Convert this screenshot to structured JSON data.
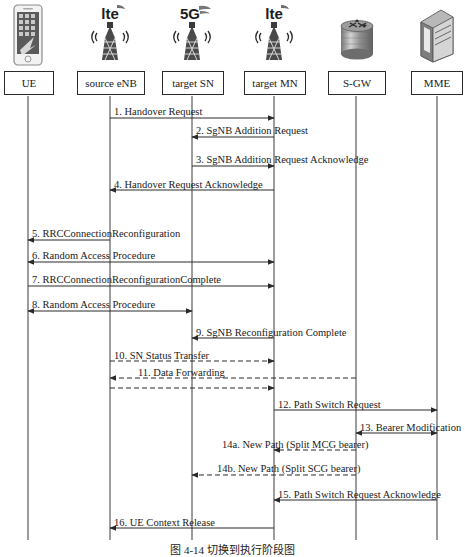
{
  "diagram": {
    "type": "sequence-diagram",
    "width": 465,
    "height": 555,
    "caption": "图 4-14  切换到执行阶段图",
    "line_color": "#2a2a2a",
    "box_border_color": "#2b2b2b"
  },
  "actors": [
    {
      "id": "ue",
      "label": "UE",
      "icon": "smartphone-icon",
      "x": 28,
      "box_x": 4,
      "box_w": 48
    },
    {
      "id": "source_enb",
      "label": "source eNB",
      "icon": "lte-tower-icon",
      "x": 110,
      "box_x": 77,
      "box_w": 66
    },
    {
      "id": "target_sn",
      "label": "target SN",
      "icon": "5g-tower-icon",
      "x": 192,
      "box_x": 162,
      "box_w": 60
    },
    {
      "id": "target_mn",
      "label": "target MN",
      "icon": "lte-tower-icon",
      "x": 274,
      "box_x": 244,
      "box_w": 60
    },
    {
      "id": "sgw",
      "label": "S-GW",
      "icon": "gateway-icon",
      "x": 356,
      "box_x": 328,
      "box_w": 56
    },
    {
      "id": "mme",
      "label": "MME",
      "icon": "server-icon",
      "x": 437,
      "box_x": 411,
      "box_w": 50
    }
  ],
  "messages": [
    {
      "num": "1.",
      "label": "1. Handover Request",
      "from": "source_enb",
      "to": "target_mn",
      "y": 118,
      "style": "solid",
      "dir": "right",
      "label_x": 114,
      "label_y": 107
    },
    {
      "num": "2.",
      "label": "2. SgNB Addition Request",
      "from": "target_mn",
      "to": "target_sn",
      "y": 137,
      "style": "solid",
      "dir": "left",
      "label_x": 196,
      "label_y": 126
    },
    {
      "num": "3.",
      "label": "3. SgNB Addition Request Acknowledge",
      "from": "target_sn",
      "to": "target_mn",
      "y": 166,
      "style": "solid",
      "dir": "right",
      "label_x": 196,
      "label_y": 155
    },
    {
      "num": "4.",
      "label": "4. Handover Request Acknowledge",
      "from": "target_mn",
      "to": "source_enb",
      "y": 190,
      "style": "solid",
      "dir": "left",
      "label_x": 114,
      "label_y": 180
    },
    {
      "num": "5.",
      "label": "5. RRCConnectionReconfiguration",
      "from": "source_enb",
      "to": "ue",
      "y": 240,
      "style": "solid",
      "dir": "left",
      "label_x": 32,
      "label_y": 229
    },
    {
      "num": "6.",
      "label": "6. Random Access Procedure",
      "from": "ue",
      "to": "target_mn",
      "y": 262,
      "style": "solid",
      "dir": "both",
      "label_x": 32,
      "label_y": 251
    },
    {
      "num": "7.",
      "label": "7. RRCConnectionReconfigurationComplete",
      "from": "ue",
      "to": "target_mn",
      "y": 286,
      "style": "solid",
      "dir": "right",
      "label_x": 32,
      "label_y": 275
    },
    {
      "num": "8.",
      "label": "8. Random Access Procedure",
      "from": "ue",
      "to": "target_sn",
      "y": 311,
      "style": "solid",
      "dir": "both",
      "label_x": 32,
      "label_y": 300
    },
    {
      "num": "9.",
      "label": "9. SgNB Reconfiguration Complete",
      "from": "target_mn",
      "to": "target_sn",
      "y": 338,
      "style": "solid",
      "dir": "left",
      "label_x": 196,
      "label_y": 328
    },
    {
      "num": "10.",
      "label": "10. SN Status Transfer",
      "from": "source_enb",
      "to": "target_mn",
      "y": 361,
      "style": "dashed",
      "dir": "right",
      "label_x": 114,
      "label_y": 351
    },
    {
      "num": "11a.",
      "label": "11. Data Forwarding",
      "from": "sgw",
      "to": "source_enb",
      "y": 378,
      "style": "dashed",
      "dir": "left",
      "label_x": 138,
      "label_y": 368
    },
    {
      "num": "11b.",
      "label": "",
      "from": "source_enb",
      "to": "target_mn",
      "y": 388,
      "style": "dashed",
      "dir": "right",
      "label_x": 0,
      "label_y": 0
    },
    {
      "num": "12.",
      "label": "12. Path Switch Request",
      "from": "target_mn",
      "to": "mme",
      "y": 410,
      "style": "solid",
      "dir": "right",
      "label_x": 278,
      "label_y": 400
    },
    {
      "num": "13.",
      "label": "13. Bearer Modification",
      "from": "sgw",
      "to": "mme",
      "y": 433,
      "style": "solid",
      "dir": "both",
      "label_x": 360,
      "label_y": 423
    },
    {
      "num": "14a.",
      "label": "14a. New Path (Split MCG bearer)",
      "from": "sgw",
      "to": "target_mn",
      "y": 450,
      "style": "dashed",
      "dir": "left",
      "label_x": 222,
      "label_y": 440
    },
    {
      "num": "14b.",
      "label": "14b. New Path (Split SCG bearer)",
      "from": "sgw",
      "to": "target_sn",
      "y": 475,
      "style": "dashed",
      "dir": "left",
      "label_x": 217,
      "label_y": 464
    },
    {
      "num": "15.",
      "label": "15. Path Switch Request Acknowledge",
      "from": "mme",
      "to": "target_mn",
      "y": 500,
      "style": "solid",
      "dir": "left",
      "label_x": 278,
      "label_y": 490
    },
    {
      "num": "16.",
      "label": "16. UE Context Release",
      "from": "target_mn",
      "to": "source_enb",
      "y": 528,
      "style": "solid",
      "dir": "left",
      "label_x": 114,
      "label_y": 518
    }
  ],
  "lifeline": {
    "top": 96,
    "bottom": 540
  }
}
